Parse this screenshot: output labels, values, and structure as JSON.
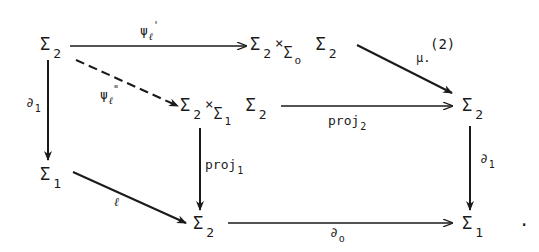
{
  "diagram": {
    "type": "commutative-diagram",
    "nodes": {
      "top_left": {
        "symbol": "Σ",
        "sub": "2"
      },
      "top_product": {
        "left": "Σ",
        "left_sub": "2",
        "times": "×",
        "base": "Σ",
        "base_sub": "o",
        "right": "Σ",
        "right_sub": "2"
      },
      "mid_product": {
        "left": "Σ",
        "left_sub": "2",
        "times": "×",
        "base": "Σ",
        "base_sub": "1",
        "right": "Σ",
        "right_sub": "2"
      },
      "mid_right": {
        "symbol": "Σ",
        "sub": "2"
      },
      "left_mid": {
        "symbol": "Σ",
        "sub": "1"
      },
      "bottom_mid": {
        "symbol": "Σ",
        "sub": "2"
      },
      "bottom_right": {
        "symbol": "Σ",
        "sub": "1"
      },
      "trailing_period": "."
    },
    "arrows": {
      "psi_prime": {
        "label": "ψ",
        "sub": "ℓ",
        "sup": "'",
        "from": "top_left",
        "to": "top_product",
        "style": "solid"
      },
      "psi_double_prime": {
        "label": "ψ",
        "sub": "ℓ",
        "sup": "\"",
        "from": "top_left",
        "to": "mid_product",
        "style": "dashed"
      },
      "mu": {
        "label": "μ.",
        "sup": "(2)",
        "from": "top_product",
        "to": "mid_right",
        "style": "solid"
      },
      "proj2": {
        "label": "proj",
        "sub": "2",
        "from": "mid_product",
        "to": "mid_right",
        "style": "solid"
      },
      "partial1_left": {
        "label": "∂",
        "sub": "1",
        "from": "top_left",
        "to": "left_mid",
        "style": "solid"
      },
      "ell": {
        "label": "ℓ",
        "from": "left_mid",
        "to": "bottom_mid",
        "style": "solid"
      },
      "proj1": {
        "label": "proj",
        "sub": "1",
        "from": "mid_product",
        "to": "bottom_mid",
        "style": "solid"
      },
      "partial0": {
        "label": "∂",
        "sub": "o",
        "from": "bottom_mid",
        "to": "bottom_right",
        "style": "solid"
      },
      "partial1_right": {
        "label": "∂",
        "sub": "1",
        "from": "mid_right",
        "to": "bottom_right",
        "style": "solid"
      }
    }
  }
}
